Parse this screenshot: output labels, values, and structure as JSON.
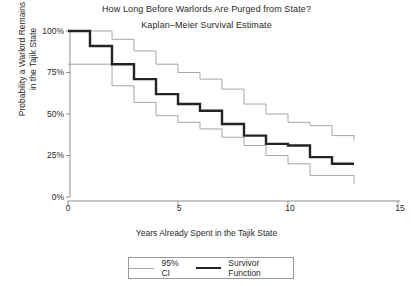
{
  "chart_data": {
    "type": "line",
    "title": "How Long Before Warlords Are Purged from State?",
    "subtitle": "Kaplan–Meier Survival Estimate",
    "xlabel": "Years Already Spent in the Tajik State",
    "ylabel_line1": "Probability a Warlord Remains",
    "ylabel_line2": "in the Tajik State",
    "xlim": [
      0,
      15
    ],
    "ylim": [
      0,
      100
    ],
    "xticks": [
      0,
      5,
      10,
      15
    ],
    "xticklabels": [
      "0",
      "5",
      "10",
      "15"
    ],
    "yticks": [
      0,
      25,
      50,
      75,
      100
    ],
    "yticklabels": [
      "0%",
      "25%",
      "50%",
      "75%",
      "100%"
    ],
    "grid": false,
    "legend_position": "below-center",
    "step_style": "post",
    "series": [
      {
        "name": "Survivor Function",
        "color": "#242424",
        "width": 2.4,
        "x": [
          0,
          1,
          2,
          3,
          4,
          5,
          6,
          7,
          8,
          9,
          10,
          11,
          12,
          13
        ],
        "values": [
          100,
          91,
          80,
          71,
          62,
          56,
          52,
          44,
          37,
          32,
          31,
          24,
          20,
          20
        ]
      },
      {
        "name": "95% CI Upper",
        "color": "#a6a6a6",
        "width": 1,
        "x": [
          0,
          1,
          2,
          3,
          4,
          5,
          6,
          7,
          8,
          9,
          10,
          11,
          12,
          13
        ],
        "values": [
          100,
          100,
          95,
          88,
          80,
          75,
          71,
          65,
          56,
          50,
          45,
          43,
          37,
          34
        ]
      },
      {
        "name": "95% CI Lower",
        "color": "#a6a6a6",
        "width": 1,
        "x": [
          0,
          1,
          2,
          3,
          4,
          5,
          6,
          7,
          8,
          9,
          10,
          11,
          12,
          13
        ],
        "values": [
          80,
          80,
          67,
          57,
          49,
          45,
          41,
          36,
          31,
          25,
          20,
          13,
          13,
          8
        ]
      }
    ],
    "legend": [
      {
        "label": "95% CI",
        "type": "ci"
      },
      {
        "label": "Survivor Function",
        "type": "survivor"
      }
    ]
  }
}
